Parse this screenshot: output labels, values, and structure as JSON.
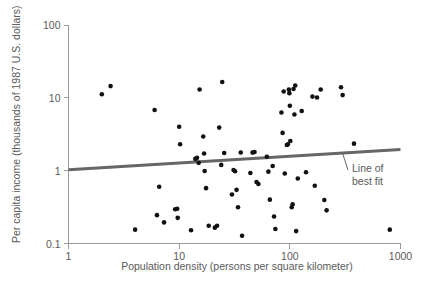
{
  "chart_data": {
    "type": "scatter",
    "title": "",
    "xlabel": "Population density (persons per square kilometer)",
    "ylabel": "Per capita income (thousands of 1987 U.S. dollars)",
    "xscale": "log",
    "yscale": "log",
    "xlim": [
      1,
      1000
    ],
    "ylim": [
      0.1,
      100
    ],
    "xticks": [
      1,
      10,
      100,
      1000
    ],
    "xtick_labels": [
      "1",
      "10",
      "100",
      "1000"
    ],
    "yticks": [
      0.1,
      1,
      10,
      100
    ],
    "ytick_labels": [
      "0.1",
      "1",
      "10",
      "100"
    ],
    "grid": false,
    "legend": false,
    "annotations": [
      {
        "name": "line-of-best-fit",
        "text_line1": "Line of",
        "text_line2": "best fit",
        "target_x": 300,
        "target_y": 1.72
      }
    ],
    "series": [
      {
        "name": "countries",
        "marker": "circle",
        "color": "#111111",
        "points": [
          [
            2.0,
            11.2
          ],
          [
            2.4,
            14.5
          ],
          [
            6.0,
            6.8
          ],
          [
            4.0,
            0.155
          ],
          [
            6.3,
            0.245
          ],
          [
            6.6,
            0.6
          ],
          [
            7.3,
            0.195
          ],
          [
            9.2,
            0.295
          ],
          [
            9.6,
            0.3
          ],
          [
            9.7,
            0.225
          ],
          [
            10.0,
            4.0
          ],
          [
            10.2,
            2.3
          ],
          [
            12.8,
            0.152
          ],
          [
            14.0,
            1.45
          ],
          [
            14.5,
            1.5
          ],
          [
            15.0,
            1.28
          ],
          [
            15.3,
            13.0
          ],
          [
            16.5,
            2.95
          ],
          [
            16.8,
            1.72
          ],
          [
            17.0,
            0.99
          ],
          [
            17.5,
            0.575
          ],
          [
            18.5,
            0.175
          ],
          [
            21.0,
            0.165
          ],
          [
            22.0,
            0.175
          ],
          [
            23.0,
            3.9
          ],
          [
            24.0,
            1.2
          ],
          [
            24.5,
            16.5
          ],
          [
            25.5,
            1.75
          ],
          [
            30.0,
            0.47
          ],
          [
            31.0,
            1.02
          ],
          [
            32.0,
            0.98
          ],
          [
            33.0,
            0.545
          ],
          [
            34.0,
            0.315
          ],
          [
            36.0,
            1.78
          ],
          [
            37.0,
            0.128
          ],
          [
            44.0,
            0.93
          ],
          [
            46.0,
            1.77
          ],
          [
            48.0,
            1.8
          ],
          [
            50.0,
            0.7
          ],
          [
            52.0,
            0.655
          ],
          [
            62.0,
            1.55
          ],
          [
            64.0,
            0.97
          ],
          [
            66.0,
            0.4
          ],
          [
            70.0,
            1.16
          ],
          [
            72.0,
            0.235
          ],
          [
            74.0,
            0.158
          ],
          [
            84.0,
            6.3
          ],
          [
            86.0,
            3.3
          ],
          [
            88.0,
            12.2
          ],
          [
            90.0,
            0.915
          ],
          [
            94.0,
            2.25
          ],
          [
            96.0,
            2.3
          ],
          [
            98.0,
            13.0
          ],
          [
            99.0,
            11.6
          ],
          [
            100.0,
            7.8
          ],
          [
            101.0,
            2.55
          ],
          [
            104.0,
            0.315
          ],
          [
            106.0,
            0.345
          ],
          [
            108.0,
            13.2
          ],
          [
            110.0,
            5.9
          ],
          [
            112.0,
            14.8
          ],
          [
            114.0,
            0.148
          ],
          [
            118.0,
            0.78
          ],
          [
            128.0,
            6.6
          ],
          [
            140.0,
            0.95
          ],
          [
            160.0,
            10.4
          ],
          [
            168.0,
            0.62
          ],
          [
            176.0,
            10.1
          ],
          [
            190.0,
            13.0
          ],
          [
            205.0,
            0.395
          ],
          [
            215.0,
            0.285
          ],
          [
            290.0,
            14.0
          ],
          [
            300.0,
            10.9
          ],
          [
            380.0,
            2.35
          ],
          [
            800.0,
            0.155
          ]
        ]
      }
    ],
    "fit_line": {
      "name": "line of best fit",
      "color": "#666666",
      "x_start": 1,
      "y_start": 1.03,
      "x_end": 1000,
      "y_end": 1.95
    }
  }
}
